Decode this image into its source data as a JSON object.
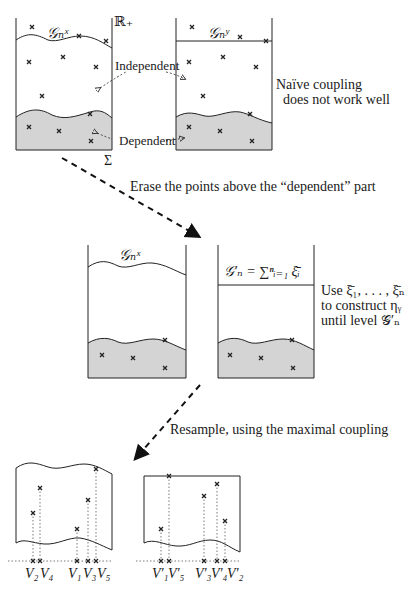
{
  "panel1": {
    "left_label": "𝒢ₙˣ",
    "right_label": "𝒢ₙʸ",
    "axis_label": "ℝ₊",
    "sigma_label": "Σ",
    "independent": "Independent",
    "dependent": "Dependent",
    "note_line1": "Naïve coupling",
    "note_line2": "does not work well"
  },
  "arrow1_caption": "Erase the points above the “dependent” part",
  "panel2": {
    "left_label": "𝒢ₙˣ",
    "right_label": "𝒢′ₙ = ∑ⁿᵢ₌₁ ξ̄ᵢ",
    "note_line1": "Use ξ̄₁, . . . , ξ̄ₙ",
    "note_line2": "to construct ηᵧ",
    "note_line3": "until level 𝒢′ₙ"
  },
  "arrow2_caption": "Resample, using the maximal coupling",
  "panel3": {
    "left_labels": [
      "V₂",
      "V₄",
      "V₁",
      "V₃",
      "V₅"
    ],
    "right_labels": [
      "V′₁",
      "V′₅",
      "V′₃",
      "V′₄",
      "V′₂"
    ]
  },
  "colors": {
    "shade": "#d4d4d4",
    "line": "#222222"
  }
}
